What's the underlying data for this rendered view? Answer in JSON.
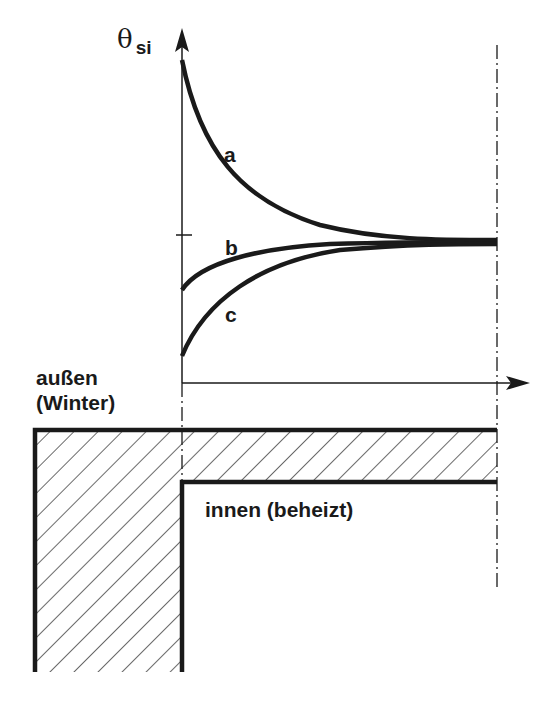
{
  "diagram": {
    "y_axis_label": {
      "symbol": "θ",
      "subscript": "si"
    },
    "curves": [
      {
        "id": "a",
        "label": "a"
      },
      {
        "id": "b",
        "label": "b"
      },
      {
        "id": "c",
        "label": "c"
      }
    ],
    "regions": {
      "outside_line1": "außen",
      "outside_line2": "(Winter)",
      "inside": "innen (beheizt)"
    },
    "colors": {
      "ink": "#1a1a1a",
      "background": "#ffffff"
    }
  }
}
